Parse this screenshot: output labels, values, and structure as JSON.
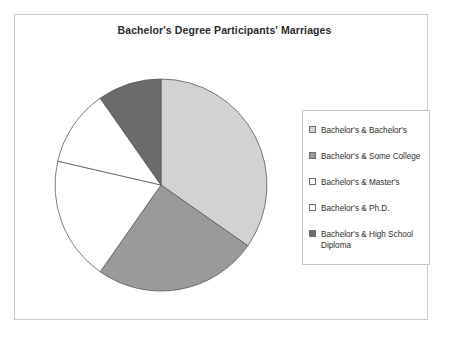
{
  "chart_data": {
    "type": "pie",
    "title": "Bachelor's Degree Participants' Marriages",
    "xlabel": "",
    "ylabel": "",
    "legend_position": "right",
    "grid": false,
    "start_angle_deg": 0,
    "direction": "clockwise",
    "categories": [
      "Bachelor's & Bachelor's",
      "Bachelor's & Some College",
      "Bachelor's & Master's",
      "Bachelor's & Ph.D.",
      "Bachelor's & High School Diploma"
    ],
    "values": [
      34.7,
      25.0,
      18.9,
      11.7,
      9.7
    ],
    "slice_angles_deg": [
      125,
      90,
      68,
      42,
      35
    ],
    "slice_colors": [
      "#d2d2d2",
      "#9a9a9a",
      "#ffffff",
      "#ffffff",
      "#6b6b6b"
    ],
    "series": [
      {
        "name": "Marriages",
        "values": [
          34.7,
          25.0,
          18.9,
          11.7,
          9.7
        ]
      }
    ]
  },
  "figure": {
    "title": "Bachelor's Degree Participants' Marriages",
    "background": "#ffffff",
    "frame_color": "#c9c9c9"
  },
  "legend": {
    "items": [
      {
        "label": "Bachelor's & Bachelor's",
        "swatch": "#d2d2d2"
      },
      {
        "label": "Bachelor's & Some College",
        "swatch": "#9a9a9a"
      },
      {
        "label": "Bachelor's & Master's",
        "swatch": "#ffffff"
      },
      {
        "label": "Bachelor's & Ph.D.",
        "swatch": "#ffffff"
      },
      {
        "label": "Bachelor's & High School\nDiploma",
        "swatch": "#6b6b6b"
      }
    ]
  }
}
